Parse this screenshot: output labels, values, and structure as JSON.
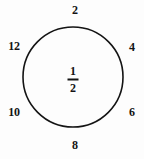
{
  "figure": {
    "kind": "circle-number-diagram",
    "background_color": "#fdfdfd",
    "ink_color": "#141414"
  },
  "circle": {
    "center_x": 73,
    "center_y": 77,
    "radius": 50,
    "stroke_width": 1.6,
    "stroke_color": "#141414",
    "fill": "none"
  },
  "center_value": {
    "numerator": "1",
    "denominator": "2",
    "display": "1/2"
  },
  "ring_labels": [
    {
      "text": "2",
      "x": 75,
      "y": 10,
      "position": "top"
    },
    {
      "text": "4",
      "x": 132,
      "y": 47,
      "position": "upper-right"
    },
    {
      "text": "6",
      "x": 132,
      "y": 112,
      "position": "lower-right"
    },
    {
      "text": "8",
      "x": 75,
      "y": 145,
      "position": "bottom"
    },
    {
      "text": "10",
      "x": 14,
      "y": 112,
      "position": "lower-left"
    },
    {
      "text": "12",
      "x": 14,
      "y": 46,
      "position": "upper-left"
    }
  ],
  "chart_data": {
    "type": "pie",
    "title": "",
    "subtitle": "",
    "xlabel": "",
    "ylabel": "",
    "categories": [
      "2",
      "4",
      "6",
      "8",
      "10",
      "12"
    ],
    "values": [
      1,
      1,
      1,
      1,
      1,
      1
    ],
    "annotations": [
      "1/2"
    ],
    "legend_position": "none",
    "grid": false
  }
}
